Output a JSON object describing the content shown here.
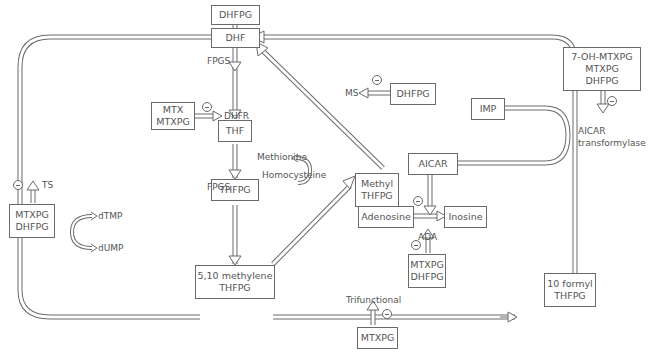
{
  "diagram": {
    "nodes": {
      "dhfpg_top": "DHFPG",
      "dhf": "DHF",
      "mtx": [
        "MTX",
        "MTXPG"
      ],
      "thf": "THF",
      "thfpg": "THFPG",
      "methylene": [
        "5,10 methylene",
        "THFPG"
      ],
      "methyl": [
        "Methyl",
        "THFPG"
      ],
      "dhfpg_ms": "DHFPG",
      "imp": "IMP",
      "aicar": "AICAR",
      "adenosine": "Adenosine",
      "inosine": "Inosine",
      "ada_inhib": [
        "MTXPG",
        "DHFPG"
      ],
      "ts_inhib": [
        "MTXPG",
        "DHFPG"
      ],
      "formyl": [
        "10 formyl",
        "THFPG"
      ],
      "trif_inhib": "MTXPG",
      "aicar_inhib": [
        "7-OH-MTXPG",
        "MTXPG",
        "DHFPG"
      ]
    },
    "labels": {
      "fpgs_top": "FPGS",
      "fpgs_mid": "FPGS",
      "dhfr": "DHFR",
      "ms": "MS",
      "methionine": "Methionine",
      "homocysteine": "Homocysteine",
      "ts": "TS",
      "dtmp": "dTMP",
      "dump": "dUMP",
      "ada": "ADA",
      "trifunctional": "Trifunctional",
      "aicar_tf": [
        "AICAR",
        "transformylase"
      ]
    },
    "inhibition_symbol": "minus-circle",
    "colors": {
      "line": "#6a6a6a",
      "text": "#555555",
      "background": "#ffffff"
    }
  }
}
